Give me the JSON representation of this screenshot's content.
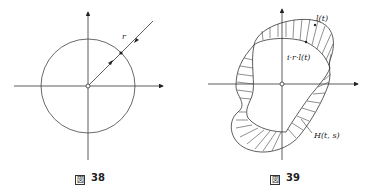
{
  "figures": [
    {
      "id": "fig38",
      "caption_prefix": "図",
      "caption_number": "38",
      "labels": {
        "radius": "r"
      },
      "description": "Circle centered at origin with coordinate axes; ray from origin through a point on the circle with arrows in both directions"
    },
    {
      "id": "fig39",
      "caption_prefix": "図",
      "caption_number": "39",
      "labels": {
        "curve": "l(t)",
        "composite": "i·r·l(t)",
        "homotopy": "H(t, s)"
      },
      "description": "Closed curve l(t) and deformed curve i·r·l(t) around origin with hatched homotopy region H(t, s) between them"
    }
  ],
  "colors": {
    "ink": "#222222",
    "background": "#ffffff"
  }
}
